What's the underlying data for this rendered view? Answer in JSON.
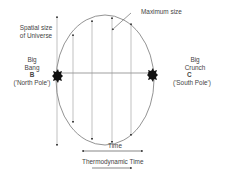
{
  "diagram": {
    "labels": {
      "y_axis": [
        "Spatial size",
        "of Universe"
      ],
      "maximum": "Maximum size",
      "big_bang": [
        "Big",
        "Bang"
      ],
      "big_bang_letter": "B",
      "big_bang_pole": "('North Pole')",
      "big_crunch": [
        "Big",
        "Crunch"
      ],
      "big_crunch_letter": "C",
      "big_crunch_pole": "('South Pole')",
      "time": "Time",
      "thermo_time": "Thermodynamic Time"
    },
    "colors": {
      "line": "#777777",
      "blob": "#111111",
      "text": "#444444"
    }
  }
}
